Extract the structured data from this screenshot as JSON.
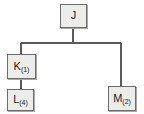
{
  "diagram": {
    "type": "tree",
    "title": "",
    "colors": {
      "node_fill": "#ececeb",
      "node_border": "#6d6d6d",
      "edge": "#5a5a5a",
      "text": "#1c1c1c",
      "background": "#ffffff",
      "shadow": "#a8a8a8"
    },
    "nodes": [
      {
        "id": "J",
        "label": "J",
        "subscript": "",
        "x": 60,
        "y": 4,
        "width": 27,
        "height": 24
      },
      {
        "id": "K",
        "label": "K",
        "subscript": "(1)",
        "x": 7,
        "y": 54,
        "width": 29,
        "height": 25
      },
      {
        "id": "L",
        "label": "L",
        "subscript": "(4)",
        "x": 7,
        "y": 89,
        "width": 27,
        "height": 22
      },
      {
        "id": "M",
        "label": "M",
        "subscript": "(2)",
        "x": 108,
        "y": 86,
        "width": 28,
        "height": 25
      }
    ],
    "edges": [
      {
        "from": "J",
        "to": "K"
      },
      {
        "from": "J",
        "to": "M"
      },
      {
        "from": "K",
        "to": "L"
      }
    ]
  }
}
